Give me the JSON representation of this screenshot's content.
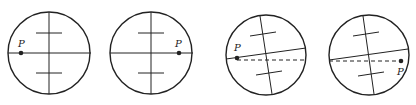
{
  "diagram": {
    "stroke_color": "#222222",
    "background": "#ffffff",
    "panels": [
      {
        "id": 1,
        "circle": {
          "cx": 49,
          "cy": 53,
          "r": 41
        },
        "horizontal": {
          "x1": 8,
          "y1": 53,
          "x2": 91,
          "y2": 53
        },
        "vertical": {
          "x1": 49,
          "y1": 12,
          "x2": 49,
          "y2": 94
        },
        "ticks": [
          {
            "x1": 36,
            "y1": 33,
            "x2": 62,
            "y2": 33
          },
          {
            "x1": 36,
            "y1": 73,
            "x2": 62,
            "y2": 73
          }
        ],
        "dashed": null,
        "point": {
          "x": 21,
          "y": 53,
          "label": "P",
          "lx": 18,
          "ly": 47
        }
      },
      {
        "id": 2,
        "circle": {
          "cx": 151,
          "cy": 53,
          "r": 41
        },
        "horizontal": {
          "x1": 110,
          "y1": 53,
          "x2": 193,
          "y2": 53
        },
        "vertical": {
          "x1": 151,
          "y1": 12,
          "x2": 151,
          "y2": 94
        },
        "ticks": [
          {
            "x1": 138,
            "y1": 33,
            "x2": 164,
            "y2": 33
          },
          {
            "x1": 138,
            "y1": 73,
            "x2": 164,
            "y2": 73
          }
        ],
        "dashed": null,
        "point": {
          "x": 179,
          "y": 53,
          "label": "P",
          "lx": 175,
          "ly": 47
        }
      },
      {
        "id": 3,
        "circle": {
          "cx": 266,
          "cy": 55,
          "r": 40
        },
        "horizontal": {
          "x1": 226,
          "y1": 59,
          "x2": 306,
          "y2": 48
        },
        "vertical": {
          "x1": 260,
          "y1": 16,
          "x2": 272,
          "y2": 94
        },
        "ticks": [
          {
            "x1": 250,
            "y1": 36,
            "x2": 276,
            "y2": 32
          },
          {
            "x1": 256,
            "y1": 75,
            "x2": 282,
            "y2": 71
          }
        ],
        "dashed": {
          "x1": 237,
          "y1": 60,
          "x2": 306,
          "y2": 60
        },
        "point": {
          "x": 237,
          "y": 58,
          "label": "P",
          "lx": 234,
          "ly": 51
        }
      },
      {
        "id": 4,
        "circle": {
          "cx": 369,
          "cy": 55,
          "r": 40
        },
        "horizontal": {
          "x1": 329,
          "y1": 60,
          "x2": 408,
          "y2": 49
        },
        "vertical": {
          "x1": 363,
          "y1": 16,
          "x2": 374,
          "y2": 94
        },
        "ticks": [
          {
            "x1": 353,
            "y1": 36,
            "x2": 379,
            "y2": 32
          },
          {
            "x1": 358,
            "y1": 76,
            "x2": 384,
            "y2": 72
          }
        ],
        "dashed": {
          "x1": 329,
          "y1": 61,
          "x2": 401,
          "y2": 61
        },
        "point": {
          "x": 401,
          "y": 61,
          "label": "P",
          "lx": 397,
          "ly": 75
        }
      }
    ]
  }
}
